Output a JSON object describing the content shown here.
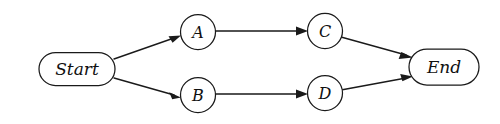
{
  "diagram": {
    "type": "flowchart",
    "background_color": "#ffffff",
    "stroke_color": "#1a1a1a",
    "fill_color": "#ffffff",
    "nodes": [
      {
        "id": "start",
        "label": "Start",
        "shape": "rounded-rectangle",
        "cx": 77,
        "cy": 69,
        "width": 76,
        "height": 33,
        "rx": 16.5
      },
      {
        "id": "a",
        "label": "A",
        "shape": "circle",
        "cx": 198,
        "cy": 32,
        "r": 17.5
      },
      {
        "id": "b",
        "label": "B",
        "shape": "circle",
        "cx": 198,
        "cy": 95,
        "r": 17.5
      },
      {
        "id": "c",
        "label": "C",
        "shape": "circle",
        "cx": 325,
        "cy": 31,
        "r": 17.5
      },
      {
        "id": "d",
        "label": "D",
        "shape": "circle",
        "cx": 325,
        "cy": 93,
        "r": 17.5
      },
      {
        "id": "end",
        "label": "End",
        "shape": "rounded-rectangle",
        "cx": 444,
        "cy": 67,
        "width": 70,
        "height": 36,
        "rx": 18
      }
    ],
    "edges": [
      {
        "id": "start-to-a",
        "from": "start",
        "to": "a",
        "label": "",
        "arrow": "filled-triangle",
        "x1": 114,
        "y1": 59,
        "x2": 180,
        "y2": 36
      },
      {
        "id": "start-to-b",
        "from": "start",
        "to": "b",
        "label": "",
        "arrow": "filled-triangle",
        "x1": 114,
        "y1": 78,
        "x2": 180,
        "y2": 97
      },
      {
        "id": "a-to-c",
        "from": "a",
        "to": "c",
        "label": "",
        "arrow": "filled-triangle",
        "x1": 216,
        "y1": 31,
        "x2": 307,
        "y2": 31
      },
      {
        "id": "b-to-d",
        "from": "b",
        "to": "d",
        "label": "",
        "arrow": "filled-triangle",
        "x1": 216,
        "y1": 94,
        "x2": 307,
        "y2": 94
      },
      {
        "id": "c-to-end",
        "from": "c",
        "to": "end",
        "label": "",
        "arrow": "filled-triangle",
        "x1": 342,
        "y1": 36,
        "x2": 412,
        "y2": 56
      },
      {
        "id": "d-to-end",
        "from": "d",
        "to": "end",
        "label": "",
        "arrow": "filled-triangle",
        "x1": 342,
        "y1": 90,
        "x2": 412,
        "y2": 77
      }
    ]
  }
}
